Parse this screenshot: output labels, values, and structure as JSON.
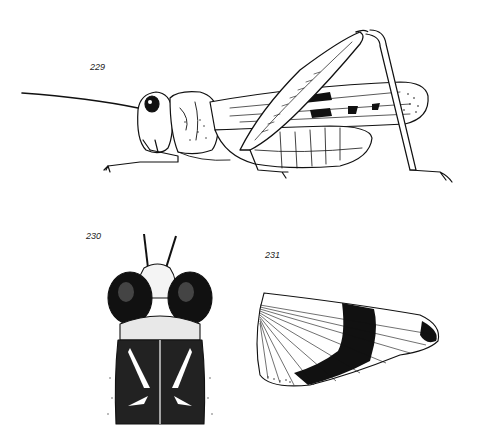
{
  "plate": {
    "background": "#ffffff",
    "ink": "#111111"
  },
  "figures": [
    {
      "label": "229",
      "subject": "grasshopper lateral view"
    },
    {
      "label": "230",
      "subject": "head and pronotum dorsal view"
    },
    {
      "label": "231",
      "subject": "hind wing with dark band"
    }
  ]
}
